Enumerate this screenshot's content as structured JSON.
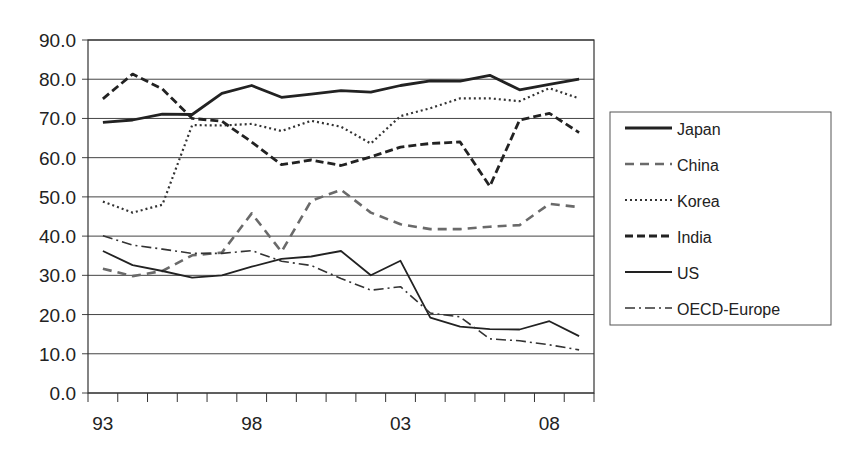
{
  "chart_data": {
    "type": "line",
    "title": "",
    "xlabel": "",
    "ylabel": "",
    "ylim": [
      0,
      90
    ],
    "yticks": [
      "0.0",
      "10.0",
      "20.0",
      "30.0",
      "40.0",
      "50.0",
      "60.0",
      "70.0",
      "80.0",
      "90.0"
    ],
    "x": [
      "93",
      "94",
      "95",
      "96",
      "97",
      "98",
      "99",
      "00",
      "01",
      "02",
      "03",
      "04",
      "05",
      "06",
      "07",
      "08",
      "09"
    ],
    "xtick_labels": [
      {
        "index": 0,
        "label": "93"
      },
      {
        "index": 5,
        "label": "98"
      },
      {
        "index": 10,
        "label": "03"
      },
      {
        "index": 15,
        "label": "08"
      }
    ],
    "grid": "horizontal",
    "legend_position": "right",
    "series": [
      {
        "name": "Japan",
        "style": "solid-thick",
        "color": "#222222",
        "values": [
          69.0,
          69.6,
          71.1,
          71.0,
          76.4,
          78.4,
          75.4,
          76.2,
          77.1,
          76.7,
          78.4,
          79.6,
          79.5,
          81.0,
          77.3,
          78.7,
          80.0
        ]
      },
      {
        "name": "China",
        "style": "dashed-gray",
        "color": "#666666",
        "values": [
          31.7,
          29.8,
          31.1,
          35.1,
          35.8,
          45.8,
          36.0,
          49.0,
          51.8,
          46.0,
          43.0,
          41.8,
          41.8,
          42.4,
          42.8,
          48.2,
          47.4
        ]
      },
      {
        "name": "Korea",
        "style": "dotted",
        "color": "#333333",
        "values": [
          48.8,
          46.0,
          48.0,
          68.3,
          68.2,
          68.6,
          66.8,
          69.4,
          67.9,
          63.6,
          70.6,
          72.6,
          75.1,
          75.1,
          74.4,
          77.7,
          75.1
        ]
      },
      {
        "name": "India",
        "style": "dashed-thick",
        "color": "#222222",
        "values": [
          75.0,
          81.3,
          77.5,
          70.0,
          69.3,
          64.0,
          58.2,
          59.4,
          58.0,
          60.2,
          62.7,
          63.6,
          64.0,
          52.7,
          69.6,
          71.3,
          66.4
        ]
      },
      {
        "name": "US",
        "style": "solid-thin",
        "color": "#222222",
        "values": [
          36.2,
          32.6,
          31.1,
          29.4,
          30.0,
          32.2,
          34.2,
          34.8,
          36.2,
          30.0,
          33.7,
          19.2,
          16.9,
          16.3,
          16.2,
          18.3,
          14.5
        ]
      },
      {
        "name": "OECD-Europe",
        "style": "dash-dot",
        "color": "#333333",
        "values": [
          40.1,
          37.7,
          36.7,
          35.6,
          35.6,
          36.3,
          33.6,
          32.5,
          29.2,
          26.2,
          27.1,
          20.4,
          19.4,
          13.8,
          13.3,
          12.3,
          11.0
        ]
      }
    ]
  },
  "legend": {
    "items": [
      "Japan",
      "China",
      "Korea",
      "India",
      "US",
      "OECD-Europe"
    ]
  }
}
